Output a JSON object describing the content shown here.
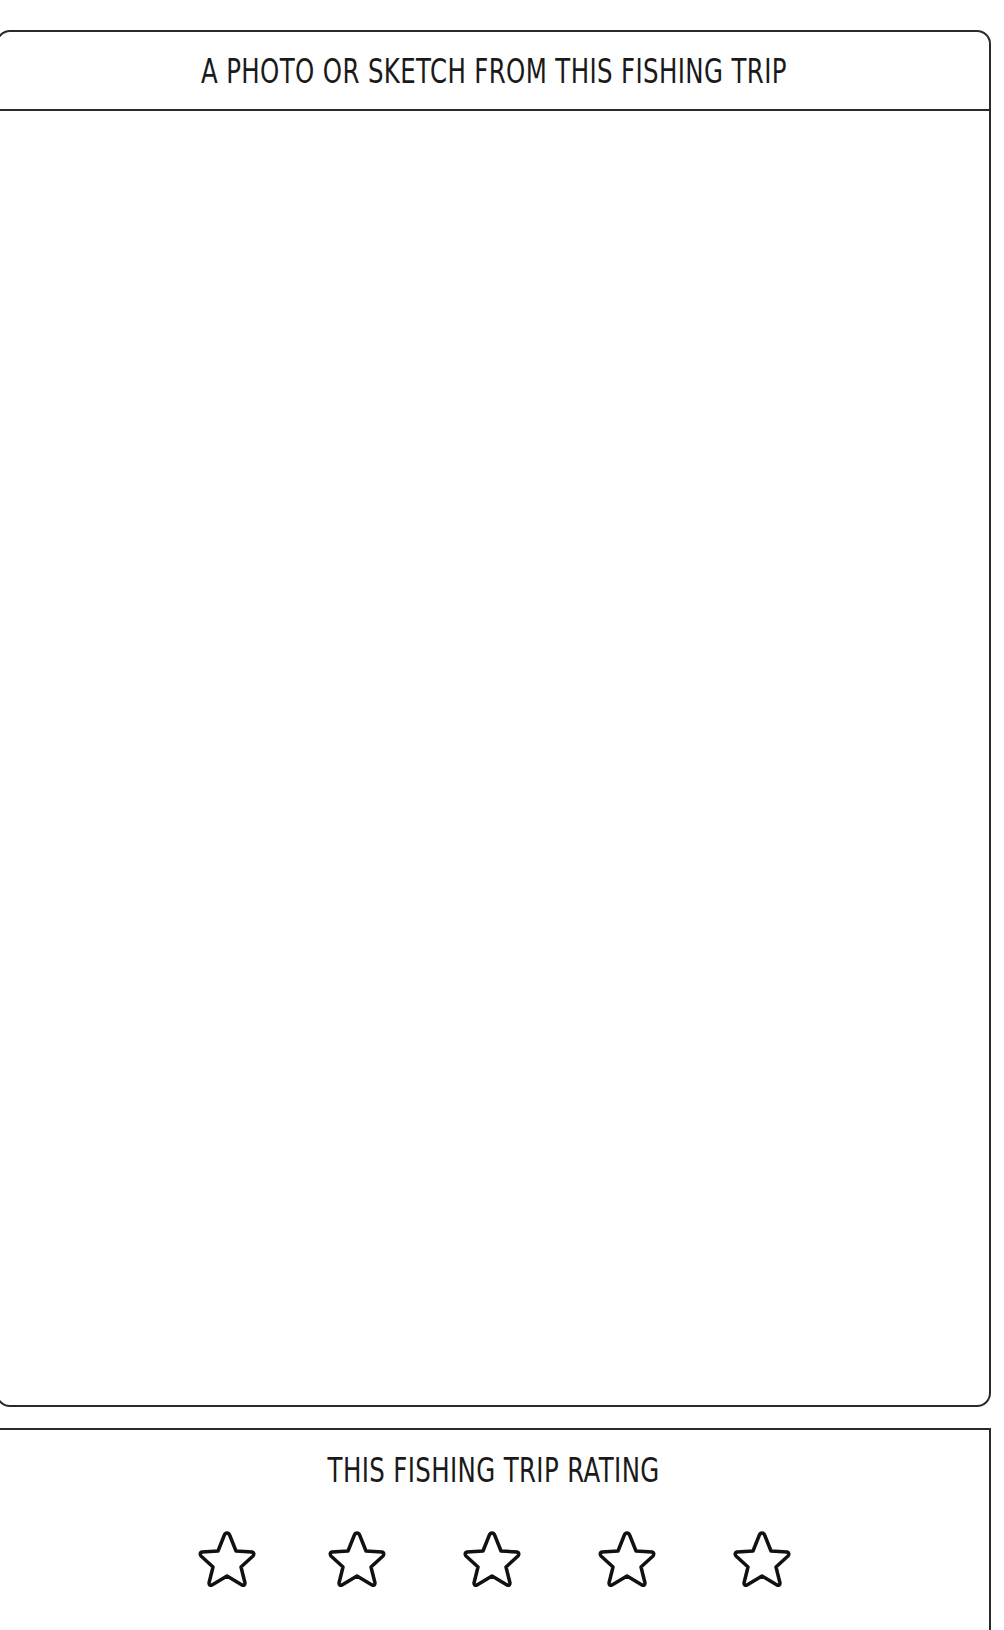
{
  "photo_section": {
    "title": "A PHOTO OR SKETCH FROM THIS FISHING TRIP"
  },
  "rating_section": {
    "title": "THIS FISHING TRIP RATING",
    "stars": [
      {
        "icon": "star-outline-icon"
      },
      {
        "icon": "star-outline-icon"
      },
      {
        "icon": "star-outline-icon"
      },
      {
        "icon": "star-outline-icon"
      },
      {
        "icon": "star-outline-icon"
      }
    ],
    "star_count": 5
  }
}
